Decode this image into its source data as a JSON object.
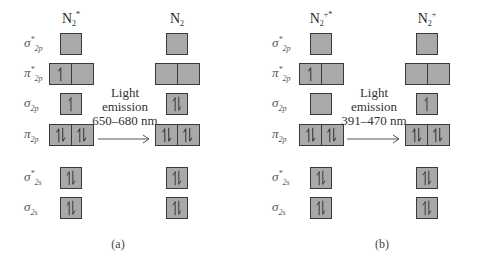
{
  "panels": [
    {
      "id": "a",
      "caption": "(a)",
      "emission": {
        "line1": "Light",
        "line2": "emission",
        "line3": "650–680 nm"
      },
      "left": {
        "species": "N",
        "sub": "2",
        "sup": "*",
        "occupancy": {
          "sigma_star_2p": [
            0
          ],
          "pi_star_2p": [
            1,
            0
          ],
          "sigma_2p": [
            1
          ],
          "pi_2p": [
            2,
            2
          ],
          "sigma_star_2s": [
            2
          ],
          "sigma_2s": [
            2
          ]
        }
      },
      "right": {
        "species": "N",
        "sub": "2",
        "sup": "",
        "occupancy": {
          "sigma_star_2p": [
            0
          ],
          "pi_star_2p": [
            0,
            0
          ],
          "sigma_2p": [
            2
          ],
          "pi_2p": [
            2,
            2
          ],
          "sigma_star_2s": [
            2
          ],
          "sigma_2s": [
            2
          ]
        }
      }
    },
    {
      "id": "b",
      "caption": "(b)",
      "emission": {
        "line1": "Light",
        "line2": "emission",
        "line3": "391–470 nm"
      },
      "left": {
        "species": "N",
        "sub": "2",
        "sup": "+*",
        "occupancy": {
          "sigma_star_2p": [
            0
          ],
          "pi_star_2p": [
            1,
            0
          ],
          "sigma_2p": [
            0
          ],
          "pi_2p": [
            2,
            2
          ],
          "sigma_star_2s": [
            2
          ],
          "sigma_2s": [
            2
          ]
        }
      },
      "right": {
        "species": "N",
        "sub": "2",
        "sup": "+",
        "occupancy": {
          "sigma_star_2p": [
            0
          ],
          "pi_star_2p": [
            0,
            0
          ],
          "sigma_2p": [
            1
          ],
          "pi_2p": [
            2,
            2
          ],
          "sigma_star_2s": [
            2
          ],
          "sigma_2s": [
            2
          ]
        }
      }
    }
  ],
  "orbital_labels": [
    {
      "key": "sigma_star_2p",
      "symbol": "σ",
      "star": "*",
      "sub": "2p"
    },
    {
      "key": "pi_star_2p",
      "symbol": "π",
      "star": "*",
      "sub": "2p"
    },
    {
      "key": "sigma_2p",
      "symbol": "σ",
      "star": "",
      "sub": "2p"
    },
    {
      "key": "pi_2p",
      "symbol": "π",
      "star": "",
      "sub": "2p"
    },
    {
      "key": "sigma_star_2s",
      "symbol": "σ",
      "star": "*",
      "sub": "2s"
    },
    {
      "key": "sigma_2s",
      "symbol": "σ",
      "star": "",
      "sub": "2s"
    }
  ],
  "colors": {
    "box_fill": "#a9a9a9",
    "box_border": "#3a3a3a",
    "arrow": "#555555"
  }
}
